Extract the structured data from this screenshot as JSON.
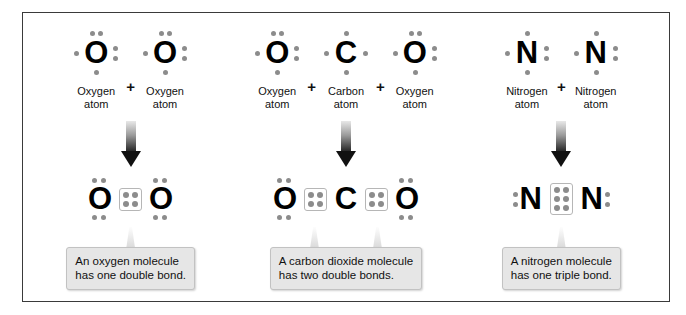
{
  "diagram": {
    "border_color": "#3a3a3a",
    "dot_color": "#8c8c8c",
    "symbol_color": "#000000",
    "callout_bg": "#e6e6e6",
    "plus_sign": "+",
    "panels": [
      {
        "id": "oxygen",
        "reactants": [
          {
            "symbol": "O",
            "label": "Oxygen\natom",
            "valence_electrons": 6,
            "dots": {
              "top": 2,
              "left": 1,
              "right": 2,
              "bottom": 1
            }
          },
          {
            "symbol": "O",
            "label": "Oxygen\natom",
            "valence_electrons": 6,
            "dots": {
              "top": 2,
              "left": 1,
              "right": 2,
              "bottom": 1
            }
          }
        ],
        "product": {
          "formula": "O2",
          "atoms": [
            "O",
            "O"
          ],
          "shared_electrons": 4,
          "bond_type": "double"
        },
        "caption": "An oxygen molecule\nhas one double bond."
      },
      {
        "id": "carbon-dioxide",
        "reactants": [
          {
            "symbol": "O",
            "label": "Oxygen\natom",
            "valence_electrons": 6,
            "dots": {
              "top": 2,
              "left": 1,
              "right": 2,
              "bottom": 1
            }
          },
          {
            "symbol": "C",
            "label": "Carbon\natom",
            "valence_electrons": 4,
            "dots": {
              "top": 1,
              "left": 1,
              "right": 1,
              "bottom": 1
            }
          },
          {
            "symbol": "O",
            "label": "Oxygen\natom",
            "valence_electrons": 6,
            "dots": {
              "top": 2,
              "left": 1,
              "right": 2,
              "bottom": 1
            }
          }
        ],
        "product": {
          "formula": "CO2",
          "atoms": [
            "O",
            "C",
            "O"
          ],
          "shared_electrons": 8,
          "bond_type": "double"
        },
        "caption": "A carbon dioxide molecule\nhas two double bonds."
      },
      {
        "id": "nitrogen",
        "reactants": [
          {
            "symbol": "N",
            "label": "Nitrogen\natom",
            "valence_electrons": 5,
            "dots": {
              "top": 1,
              "left": 1,
              "right": 2,
              "bottom": 1
            }
          },
          {
            "symbol": "N",
            "label": "Nitrogen\natom",
            "valence_electrons": 5,
            "dots": {
              "top": 1,
              "left": 1,
              "right": 2,
              "bottom": 1
            }
          }
        ],
        "product": {
          "formula": "N2",
          "atoms": [
            "N",
            "N"
          ],
          "shared_electrons": 6,
          "bond_type": "triple"
        },
        "caption": "A nitrogen molecule\nhas one triple bond."
      }
    ]
  }
}
